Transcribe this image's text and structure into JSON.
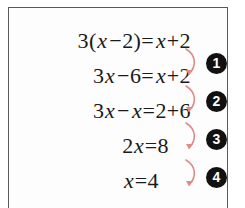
{
  "box": {
    "border_color": "#5a5a5a",
    "background": "#fdfdfd"
  },
  "equations": [
    {
      "id": "line-1",
      "text": "3(x−2)=x+2",
      "parts": [
        "3(",
        "x",
        "−2)=",
        "x",
        "+2"
      ]
    },
    {
      "id": "line-2",
      "text": "3x−6=x+2",
      "parts": [
        "3",
        "x",
        "−6=",
        "x",
        "+2"
      ]
    },
    {
      "id": "line-3",
      "text": "3x−x=2+6",
      "parts": [
        "3",
        "x",
        "−",
        "x",
        "=2+6"
      ]
    },
    {
      "id": "line-4",
      "text": "2x=8",
      "parts": [
        "2",
        "x",
        "=8"
      ]
    },
    {
      "id": "line-5",
      "text": "x=4",
      "parts": [
        "",
        "x",
        "=4"
      ]
    }
  ],
  "eq1": {
    "a": "3(",
    "x1": "x",
    "b": "−2)=",
    "x2": "x",
    "c": "+2"
  },
  "eq2": {
    "a": "3",
    "x1": "x",
    "b": "−6=",
    "x2": "x",
    "c": "+2"
  },
  "eq3": {
    "a": "3",
    "x1": "x",
    "b": "−",
    "x2": "x",
    "c": "=2+6"
  },
  "eq4": {
    "a": "2",
    "x1": "x",
    "c": "=8"
  },
  "eq5": {
    "x1": "x",
    "c": "=4"
  },
  "steps": [
    {
      "number": "1",
      "label": "step-1"
    },
    {
      "number": "2",
      "label": "step-2"
    },
    {
      "number": "3",
      "label": "step-3"
    },
    {
      "number": "4",
      "label": "step-4"
    }
  ],
  "arrows": {
    "color": "#e08a8a",
    "count": 4,
    "shape": "curved-down-left-hook"
  }
}
